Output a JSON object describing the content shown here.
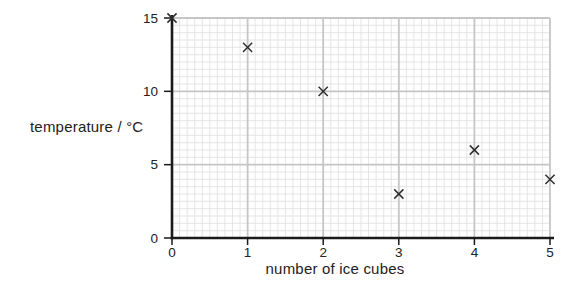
{
  "chart_data": {
    "type": "scatter",
    "title": "",
    "xlabel": "number of ice cubes",
    "ylabel": "temperature / °C",
    "x": [
      0,
      1,
      2,
      3,
      4,
      5
    ],
    "y": [
      15,
      13,
      10,
      3,
      6,
      4
    ],
    "marker": "x",
    "xlim": [
      0,
      5
    ],
    "ylim": [
      0,
      15
    ],
    "xticks": [
      0,
      1,
      2,
      3,
      4,
      5
    ],
    "yticks": [
      0,
      5,
      10,
      15
    ],
    "x_minor_step": 0.1,
    "y_minor_step": 0.5,
    "grid": "minor+major",
    "legend": "none",
    "colors": {
      "background": "#ffffff",
      "minor_grid": "#e2e2e2",
      "major_grid": "#c6c6c6",
      "axis": "#1a1a1a",
      "text": "#222222",
      "marker": "#2e2e2e"
    }
  }
}
